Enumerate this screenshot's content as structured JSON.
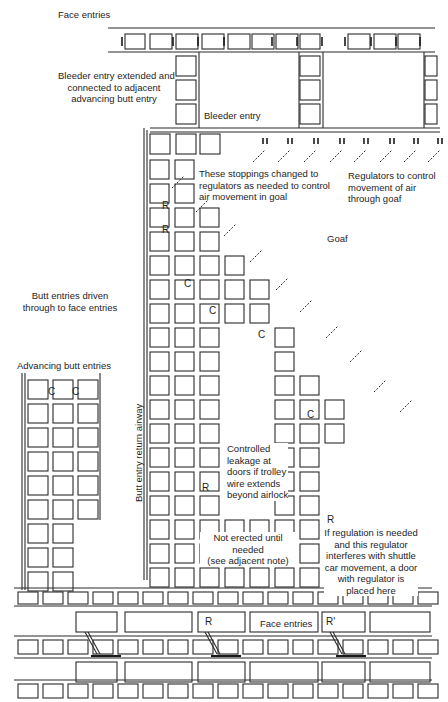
{
  "figure": {
    "type": "mine ventilation plan",
    "background": "#ffffff",
    "ink_color": "#1e1e1e"
  },
  "labels": {
    "face_entries_top": "Face entries",
    "bleeder_extended": [
      "Bleeder entry extended and",
      "connected to adjacent",
      "advancing butt entry"
    ],
    "bleeder_entry": "Bleeder entry",
    "stoppings_changed": [
      "These stoppings changed to",
      "regulators as needed to control",
      "air movement in goal"
    ],
    "regulators_goaf": [
      "Regulators to control",
      "movement of air",
      "through goaf"
    ],
    "goaf": "Goaf",
    "butt_driven": [
      "Butt entries driven",
      "through to face entries"
    ],
    "advancing_butt": "Advancing butt entries",
    "return_airway": "Butt entry return airway",
    "controlled_leakage": [
      "Controlled",
      "leakage at",
      "doors if trolley",
      "wire extends",
      "beyond airlock"
    ],
    "not_erected": [
      "Not erected until",
      "needed",
      "(see adjacent note)"
    ],
    "if_regulation": [
      "If regulation is needed",
      "and this regulator",
      "interferes with shuttle",
      "car movement, a door",
      "with regulator is",
      "placed here"
    ],
    "face_entries_bottom": "Face entries"
  },
  "markers": {
    "regulator": "R",
    "regulator_prime": "R'",
    "crosscut": "C",
    "regulator_symbol": "α"
  },
  "legend_symbols": [
    {
      "name": "stopping",
      "glyph": "H"
    },
    {
      "name": "regulator",
      "glyph": "R"
    },
    {
      "name": "overcast/crossing",
      "glyph": "C"
    }
  ]
}
